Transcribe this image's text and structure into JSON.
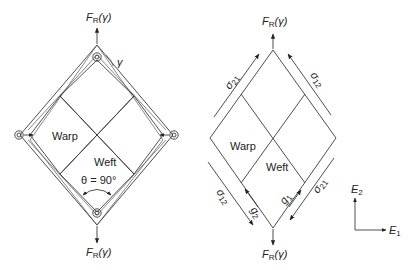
{
  "left_diagram": {
    "force_label_top": "F",
    "force_label_top_sub": "R",
    "force_label_top_arg": "(γ)",
    "force_label_bottom": "F",
    "force_label_bottom_sub": "R",
    "force_label_bottom_arg": "(γ)",
    "gamma_label": "γ",
    "warp_label": "Warp",
    "weft_label": "Weft",
    "angle_label": "θ = 90°"
  },
  "right_diagram": {
    "force_label_top": "F",
    "force_label_top_sub": "R",
    "force_label_top_arg": "(γ)",
    "force_label_bottom": "F",
    "force_label_bottom_sub": "R",
    "force_label_bottom_arg": "(γ)",
    "warp_label": "Warp",
    "weft_label": "Weft",
    "sigma_upper_left": "σ",
    "sigma_upper_left_sub": "21",
    "sigma_upper_right": "σ",
    "sigma_upper_right_sub": "12",
    "sigma_lower_left": "σ",
    "sigma_lower_left_sub": "12",
    "sigma_lower_right": "σ",
    "sigma_lower_right_sub": "21",
    "g1_label": "g",
    "g1_sub": "1",
    "g2_label": "g",
    "g2_sub": "2"
  },
  "axes": {
    "e2_label": "E",
    "e2_sub": "2",
    "e1_label": "E",
    "e1_sub": "1"
  }
}
